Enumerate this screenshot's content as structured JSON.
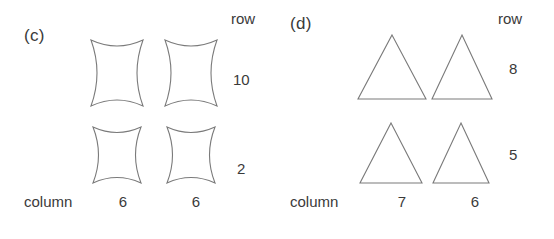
{
  "figure": {
    "background_color": "#ffffff",
    "stroke_color": "#7a7a7a",
    "text_color": "#3a3a3a"
  },
  "panels": [
    {
      "label": "(c)",
      "shape_type": "concave-square",
      "row_header": "row",
      "column_header": "column",
      "row_values": [
        "10",
        "2"
      ],
      "column_values": [
        "6",
        "6"
      ],
      "cells": [
        [
          {
            "shape": "concave-square"
          },
          {
            "shape": "concave-square"
          }
        ],
        [
          {
            "shape": "concave-square"
          },
          {
            "shape": "concave-square"
          }
        ]
      ]
    },
    {
      "label": "(d)",
      "shape_type": "triangle",
      "row_header": "row",
      "column_header": "column",
      "row_values": [
        "8",
        "5"
      ],
      "column_values": [
        "7",
        "6"
      ],
      "cells": [
        [
          {
            "shape": "triangle"
          },
          {
            "shape": "triangle"
          }
        ],
        [
          {
            "shape": "triangle"
          },
          {
            "shape": "triangle"
          }
        ]
      ]
    }
  ]
}
